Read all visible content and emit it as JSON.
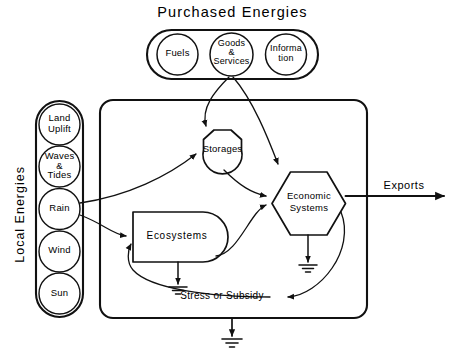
{
  "diagram": {
    "title": "Purchased Energies",
    "side_label": "Local Energies",
    "purchased_sources": [
      {
        "name": "fuels",
        "label": "Fuels"
      },
      {
        "name": "goods-and-services",
        "label": "Goods\n&\nServices"
      },
      {
        "name": "information",
        "label": "Informa\ntion"
      }
    ],
    "local_sources": [
      {
        "name": "land-uplift",
        "label": "Land\nUplift"
      },
      {
        "name": "waves-and-tides",
        "label": "Waves\n&\nTides"
      },
      {
        "name": "rain",
        "label": "Rain"
      },
      {
        "name": "wind",
        "label": "Wind"
      },
      {
        "name": "sun",
        "label": "Sun"
      }
    ],
    "system_components": [
      {
        "name": "storages",
        "label": "Storages",
        "shape": "tank"
      },
      {
        "name": "ecosystems",
        "label": "Ecosystems",
        "shape": "producer"
      },
      {
        "name": "economic-systems",
        "label": "Economic\nSystems",
        "shape": "hexagon"
      }
    ],
    "flow_labels": [
      {
        "name": "exports",
        "label": "Exports"
      },
      {
        "name": "stress-or-subsidy",
        "label": "Stress or Subsidy"
      }
    ],
    "colors": {
      "ink": "#111111",
      "background": "#ffffff"
    }
  }
}
